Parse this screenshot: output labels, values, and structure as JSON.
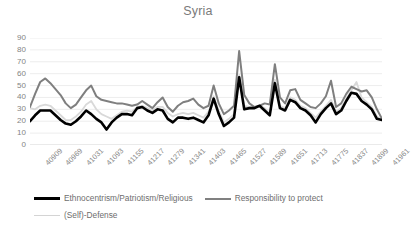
{
  "chart_data": {
    "type": "line",
    "title": "Syria",
    "xlabel": "",
    "ylabel": "",
    "ylim": [
      0,
      90
    ],
    "ytick_step": 10,
    "yticks": [
      90,
      80,
      70,
      60,
      50,
      40,
      30,
      20,
      10,
      0
    ],
    "grid": true,
    "legend_position": "bottom",
    "categories": [
      "40909",
      "40923",
      "40937",
      "40951",
      "40969",
      "40983",
      "40997",
      "41011",
      "41031",
      "41045",
      "41059",
      "41073",
      "41093",
      "41107",
      "41121",
      "41135",
      "41155",
      "41169",
      "41183",
      "41197",
      "41217",
      "41231",
      "41245",
      "41259",
      "41279",
      "41293",
      "41307",
      "41321",
      "41341",
      "41355",
      "41369",
      "41383",
      "41403",
      "41417",
      "41431",
      "41445",
      "41465",
      "41479",
      "41493",
      "41507",
      "41527",
      "41541",
      "41555",
      "41569",
      "41589",
      "41603",
      "41617",
      "41631",
      "41651",
      "41665",
      "41679",
      "41693",
      "41713",
      "41727",
      "41741",
      "41755",
      "41775",
      "41789",
      "41803",
      "41817",
      "41837",
      "41851",
      "41865",
      "41879",
      "41899",
      "41913",
      "41927",
      "41941",
      "41961",
      "41975"
    ],
    "xtick_labels": [
      "40909",
      "40969",
      "41031",
      "41093",
      "41155",
      "41217",
      "41279",
      "41341",
      "41403",
      "41465",
      "41527",
      "41589",
      "41651",
      "41713",
      "41775",
      "41837",
      "41899",
      "41961"
    ],
    "series": [
      {
        "name": "Ethnocentrism/Patriotism/Religious",
        "color": "#000000",
        "width": 2.6,
        "values": [
          20,
          25,
          29,
          29,
          29,
          25,
          21,
          18,
          17,
          20,
          24,
          29,
          26,
          22,
          19,
          13,
          19,
          23,
          26,
          26,
          25,
          31,
          32,
          29,
          27,
          30,
          29,
          22,
          19,
          23,
          23,
          22,
          23,
          21,
          19,
          25,
          39,
          26,
          16,
          19,
          23,
          57,
          30,
          31,
          31,
          33,
          29,
          25,
          52,
          31,
          29,
          38,
          36,
          31,
          29,
          25,
          19,
          26,
          31,
          35,
          26,
          29,
          37,
          44,
          43,
          37,
          34,
          30,
          22,
          21
        ]
      },
      {
        "name": "Responsibility to protect",
        "color": "#7f7f7f",
        "width": 2.0,
        "values": [
          32,
          43,
          53,
          56,
          52,
          47,
          42,
          35,
          31,
          34,
          40,
          46,
          50,
          41,
          38,
          37,
          36,
          35,
          35,
          34,
          33,
          34,
          37,
          34,
          31,
          36,
          40,
          32,
          28,
          33,
          36,
          37,
          39,
          34,
          31,
          33,
          50,
          35,
          26,
          29,
          33,
          79,
          42,
          35,
          32,
          33,
          35,
          34,
          68,
          40,
          35,
          46,
          47,
          38,
          35,
          32,
          31,
          35,
          41,
          54,
          32,
          35,
          43,
          49,
          47,
          45,
          46,
          40,
          30,
          22
        ]
      },
      {
        "name": "(Self)-Defense",
        "color": "#d9d9d9",
        "width": 1.8,
        "values": [
          31,
          30,
          33,
          34,
          33,
          29,
          25,
          21,
          21,
          24,
          28,
          34,
          37,
          30,
          26,
          24,
          22,
          25,
          28,
          29,
          28,
          32,
          33,
          31,
          29,
          32,
          32,
          27,
          24,
          26,
          27,
          26,
          27,
          25,
          23,
          28,
          41,
          29,
          19,
          22,
          26,
          59,
          33,
          32,
          32,
          33,
          31,
          27,
          55,
          33,
          31,
          40,
          38,
          33,
          31,
          27,
          23,
          28,
          33,
          38,
          28,
          31,
          39,
          46,
          53,
          40,
          36,
          32,
          24,
          21
        ]
      }
    ]
  },
  "legend": {
    "items": [
      {
        "label": "Ethnocentrism/Patriotism/Religious"
      },
      {
        "label": "Responsibility to protect"
      },
      {
        "label": "(Self)-Defense"
      }
    ]
  }
}
